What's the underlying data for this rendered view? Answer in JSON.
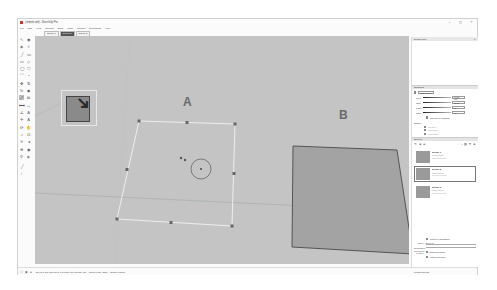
{
  "window": {
    "title": "(스케치업 파일) - SketchUp Pro",
    "controls": [
      "minimize",
      "maximize",
      "close"
    ]
  },
  "menu": {
    "items": [
      "File",
      "Edit",
      "View",
      "Camera",
      "Draw",
      "Tools",
      "Window",
      "Extensions",
      "Help"
    ]
  },
  "scene_tabs": [
    {
      "label": "Scene 1",
      "active": false
    },
    {
      "label": "Scene 2",
      "active": true
    },
    {
      "label": "Scene 3",
      "active": false
    }
  ],
  "canvas": {
    "background": "#c4c4c4",
    "label_a": "A",
    "label_b": "B",
    "face_b_color": "#a3a3a3"
  },
  "status": {
    "text": "Select a grip and move it to scale the objects. Ctrl = about center, Shift = Toggle uniform.",
    "measurements_label": "Measurements"
  },
  "tray": {
    "title": "Default Tray",
    "shadows": {
      "header": "Shadows",
      "utc_label": "UTC+09:00",
      "time_label": "Time",
      "time_values": [
        "03:30 AM",
        "Noon",
        "04:30 PM"
      ],
      "time_value": "01:30 PM",
      "date_label": "Date",
      "date_months": "J F M A M J J A S O N D",
      "date_value": "11/08",
      "light_label": "Light",
      "light_value": "80",
      "dark_label": "Dark",
      "dark_value": "45",
      "use_sun_label": "Use sun for shading",
      "display_label": "Display:",
      "display_options": [
        "On faces",
        "On ground",
        "From edges"
      ]
    },
    "scenes": {
      "header": "Scenes",
      "items": [
        {
          "name": "Scene 1",
          "props": "Props: None",
          "desc": "(No description)",
          "selected": false
        },
        {
          "name": "Scene 2",
          "props": "Props: None",
          "desc": "(No description)",
          "selected": true
        },
        {
          "name": "Scene 3",
          "props": "Props: None",
          "desc": "(No description)",
          "selected": false
        }
      ],
      "include_animation_label": "Include in animation",
      "name_label": "Name:",
      "name_value": "Scene 2",
      "description_label": "Description:",
      "description_value": "",
      "properties_label": "Properties to save:",
      "property_options": [
        "Camera Location",
        "Hidden Geometry"
      ]
    }
  },
  "icons": {
    "select": "↖",
    "paint": "◈",
    "eraser": "◊",
    "line": "╱",
    "rect": "▭",
    "circle": "◯",
    "arc": "⌒",
    "move": "✥",
    "rotate": "↻",
    "scale": "⤢",
    "pushpull": "⇅",
    "offset": "⧉",
    "tape": "⟷",
    "text": "A",
    "axes": "✛",
    "orbit": "⟳",
    "pan": "✋",
    "zoom": "⌕",
    "walk": "⚲",
    "position": "⊕"
  }
}
